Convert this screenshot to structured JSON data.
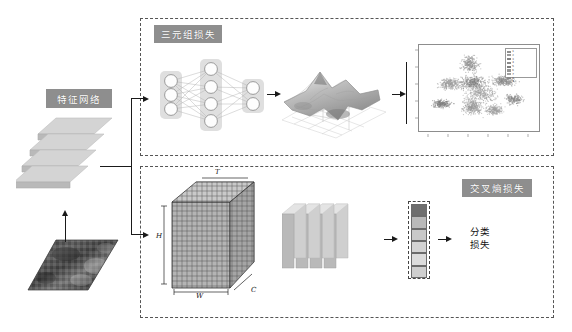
{
  "figure": {
    "type": "architecture-diagram"
  },
  "labels": {
    "feature_network": "特征网络",
    "triplet_loss": "三元组损失",
    "cross_entropy_loss": "交叉熵损失",
    "classification_loss_line1": "分类",
    "classification_loss_line2": "损失",
    "dim_t": "T",
    "dim_h": "H",
    "dim_w": "W",
    "dim_c": "C"
  },
  "colors": {
    "chip_bg": "#8e8e8e",
    "chip_text": "#ffffff",
    "dash_border": "#555555",
    "slab_top": "#d2d2d2",
    "slab_front": "#bdbdbd",
    "node_fill": "#fdfdfd",
    "node_stroke": "#9a9a9a",
    "panel_bg": "#dfdfdf",
    "arrow": "#1a1a1a",
    "plot_border": "#8d8d8d"
  },
  "neural_network": {
    "layers": [
      {
        "name": "input-layer",
        "nodes": 3
      },
      {
        "name": "hidden-layer",
        "nodes": 4
      },
      {
        "name": "output-layer",
        "nodes": 2
      }
    ]
  },
  "feature_stack": {
    "slab_count": 4
  },
  "conv_plates": {
    "plate_count": 4
  },
  "class_vector": {
    "cells": [
      {
        "index": 1,
        "color": "#6e6e6e"
      },
      {
        "index": 2,
        "color": "#b9b9b9"
      },
      {
        "index": 3,
        "color": "#c9c9c9"
      },
      {
        "index": 4,
        "color": "#d4d4d4"
      },
      {
        "index": 5,
        "color": "#dcdcdc"
      },
      {
        "index": 6,
        "color": "#cfcfcf"
      }
    ]
  },
  "cube": {
    "faces": 5,
    "rows": 22,
    "cols": 15
  },
  "chart_data": [
    {
      "type": "surface",
      "name": "loss-landscape-surface",
      "title": "",
      "xlabel": "",
      "ylabel": "",
      "zlabel": "",
      "description": "3D mesh surface plot of a loss landscape with a tall central peak, several secondary ridges and a deep basin toward the front-right",
      "peaks": [
        {
          "x": -0.35,
          "y": 0.45,
          "z": 1.0
        },
        {
          "x": 0.15,
          "y": 0.05,
          "z": 0.55
        },
        {
          "x": 0.55,
          "y": -0.35,
          "z": 0.35
        }
      ],
      "valleys": [
        {
          "x": 0.3,
          "y": -0.55,
          "z": -0.75
        },
        {
          "x": -0.55,
          "y": -0.2,
          "z": -0.3
        }
      ],
      "grid": true,
      "legend": false
    },
    {
      "type": "scatter",
      "name": "tsne-feature-embedding",
      "title": "",
      "xlabel": "",
      "ylabel": "",
      "xlim": [
        -50,
        50
      ],
      "ylim": [
        -50,
        50
      ],
      "xticks": [
        -40,
        -30,
        -20,
        -10,
        0,
        10,
        20,
        30,
        40
      ],
      "yticks": [
        -40,
        -30,
        -20,
        -10,
        0,
        10,
        20,
        30,
        40
      ],
      "grid": false,
      "legend_position": "top-right",
      "series": [
        {
          "name": "1",
          "color": "#8f8f8f",
          "cx": -8,
          "cy": 30,
          "sx": 7,
          "sy": 9,
          "n": 260
        },
        {
          "name": "2",
          "color": "#9a9a9a",
          "cx": -26,
          "cy": 4,
          "sx": 9,
          "sy": 7,
          "n": 300
        },
        {
          "name": "3",
          "color": "#828282",
          "cx": -5,
          "cy": 6,
          "sx": 10,
          "sy": 8,
          "n": 340
        },
        {
          "name": "4",
          "color": "#8a8a8a",
          "cx": 22,
          "cy": 8,
          "sx": 10,
          "sy": 6,
          "n": 280
        },
        {
          "name": "5",
          "color": "#7d7d7d",
          "cx": -34,
          "cy": -22,
          "sx": 8,
          "sy": 5,
          "n": 220
        },
        {
          "name": "6",
          "color": "#959595",
          "cx": -6,
          "cy": -26,
          "sx": 8,
          "sy": 9,
          "n": 300
        },
        {
          "name": "7",
          "color": "#a0a0a0",
          "cx": 14,
          "cy": -30,
          "sx": 7,
          "sy": 6,
          "n": 240
        },
        {
          "name": "8",
          "color": "#888888",
          "cx": 32,
          "cy": -16,
          "sx": 7,
          "sy": 6,
          "n": 200
        },
        {
          "name": "9",
          "color": "#9e9e9e",
          "cx": 2,
          "cy": -8,
          "sx": 12,
          "sy": 11,
          "n": 360
        }
      ],
      "legend_entries": [
        "1",
        "2",
        "3",
        "4",
        "5",
        "6",
        "7",
        "8",
        "9"
      ]
    }
  ]
}
